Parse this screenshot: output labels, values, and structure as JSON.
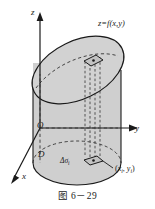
{
  "figure": {
    "caption": "图 6－29",
    "surface_label": "z=f(x,y)",
    "axes": {
      "z": "z",
      "y": "y",
      "x": "x",
      "origin": "O"
    },
    "region_label": "D",
    "element_label_base": "Δσ",
    "element_label_sub": "i",
    "point_label_open": "(",
    "point_label_x": "x",
    "point_label_xsub": "i",
    "point_label_comma": ", ",
    "point_label_y": "y",
    "point_label_ysub": "i",
    "point_label_close": ")",
    "colors": {
      "surface_fill": "#d2d2d2",
      "body_fill": "#cfcfcf",
      "top_fill": "#c9c9c9",
      "stroke": "#1a1a1a",
      "dashed_stroke": "#3a3a3a",
      "background": "#ffffff"
    }
  }
}
